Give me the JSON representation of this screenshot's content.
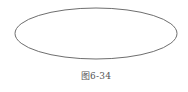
{
  "figure": {
    "shape": "ellipse",
    "ellipse": {
      "cx": 96,
      "cy": 33.5,
      "rx": 81,
      "ry": 25.5,
      "stroke": "#6e6e6e",
      "stroke_width": 1,
      "fill": "none"
    },
    "caption": "图6-34"
  },
  "colors": {
    "background": "#ffffff",
    "stroke": "#6e6e6e",
    "caption": "#555555"
  }
}
